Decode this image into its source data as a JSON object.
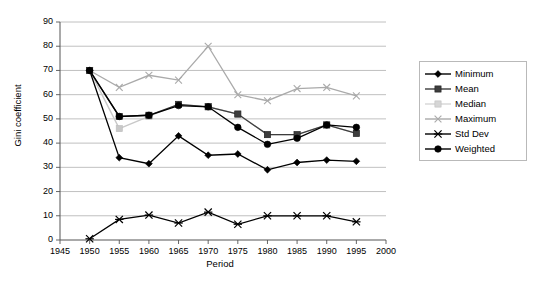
{
  "chart_data": {
    "type": "line",
    "title": "",
    "xlabel": "Period",
    "ylabel": "Gini coefficient",
    "xlim": [
      1945,
      2000
    ],
    "ylim": [
      0,
      90
    ],
    "xticks": [
      "1945",
      "1950",
      "1955",
      "1960",
      "1965",
      "1970",
      "1975",
      "1980",
      "1985",
      "1990",
      "1995",
      "2000"
    ],
    "yticks": [
      "0",
      "10",
      "20",
      "30",
      "40",
      "50",
      "60",
      "70",
      "80",
      "90"
    ],
    "grid": "horizontal",
    "legend_position": "right",
    "x": [
      1950,
      1955,
      1960,
      1965,
      1970,
      1975,
      1980,
      1985,
      1990,
      1995
    ],
    "series": [
      {
        "name": "Minimum",
        "marker": "diamond",
        "color": "#000000",
        "values": [
          70,
          34,
          31.5,
          43,
          35,
          35.5,
          29,
          32,
          33,
          32.5
        ]
      },
      {
        "name": "Mean",
        "marker": "square",
        "color": "#3d3d3d",
        "values": [
          70,
          51,
          51.5,
          56,
          55,
          52,
          43.5,
          43.5,
          47.5,
          44
        ]
      },
      {
        "name": "Median",
        "marker": "square-light",
        "color": "#c8c8c8",
        "values": [
          70,
          46,
          51,
          56,
          55,
          52,
          43.5,
          43.5,
          47.5,
          44
        ]
      },
      {
        "name": "Maximum",
        "marker": "cross",
        "color": "#aaaaaa",
        "values": [
          70,
          63,
          68,
          66,
          80,
          60,
          57.5,
          62.5,
          63,
          59.5
        ]
      },
      {
        "name": "Std Dev",
        "marker": "asterisk",
        "color": "#000000",
        "values": [
          0.5,
          8.5,
          10.3,
          7,
          11.5,
          6.5,
          10,
          10,
          10,
          7.5
        ]
      },
      {
        "name": "Weighted",
        "marker": "circle",
        "color": "#000000",
        "values": [
          70,
          51,
          51.5,
          55.5,
          55,
          46.5,
          39.5,
          42,
          47.5,
          46.5
        ]
      }
    ]
  },
  "legend": {
    "items": [
      {
        "label": "Minimum"
      },
      {
        "label": "Mean"
      },
      {
        "label": "Median"
      },
      {
        "label": "Maximum"
      },
      {
        "label": "Std Dev"
      },
      {
        "label": "Weighted"
      }
    ]
  }
}
